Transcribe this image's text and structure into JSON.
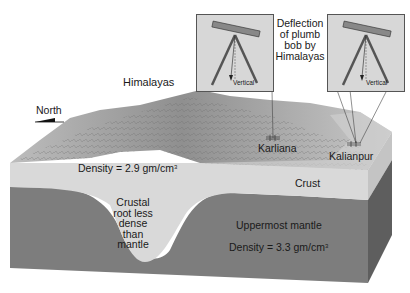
{
  "diagram": {
    "type": "block-diagram",
    "labels": {
      "north": "North",
      "himalayas": "Himalayas",
      "deflection_line1": "Deflection",
      "deflection_line2": "of plumb",
      "deflection_line3": "bob by",
      "deflection_line4": "Himalayas",
      "karliana": "Karliana",
      "kalianpur": "Kalianpur",
      "crust_density_text": "Density = 2.9 gm/cm",
      "crust_density_sup": "3",
      "crust": "Crust",
      "root_line1": "Crustal",
      "root_line2": "root less",
      "root_line3": "dense",
      "root_line4": "than",
      "root_line5": "mantle",
      "mantle": "Uppermost mantle",
      "mantle_density_text": "Density = 3.3 gm/cm",
      "mantle_density_sup": "3",
      "inset_left_vertical": "Vertical",
      "inset_right_vertical": "Vertical"
    },
    "colors": {
      "crust": "#d9d9d9",
      "mantle": "#7d7d7d",
      "mantle_side": "#5e5e5e",
      "crust_side": "#c8c8c8",
      "terrain": "#a9a9a9",
      "inset_bg": "#d7d7d7"
    }
  }
}
